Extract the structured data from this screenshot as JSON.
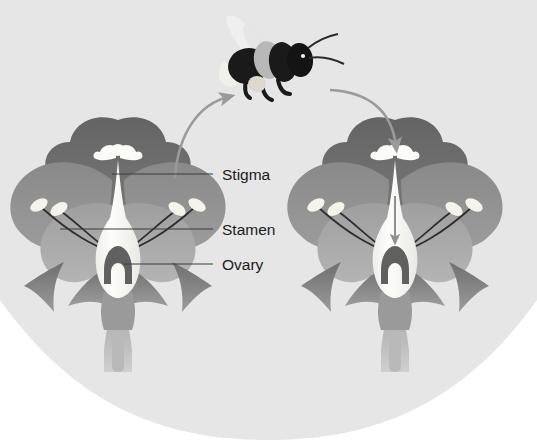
{
  "scene": {
    "title": "Flower pollination diagram",
    "background_color": "#ffffff",
    "backdrop_color": "#e6e6e6"
  },
  "labels": [
    {
      "id": "stigma",
      "text": "Stigma",
      "x": 222,
      "y": 180,
      "leader_from_x": 213,
      "leader_to_x": 112,
      "leader_y": 174
    },
    {
      "id": "stamen",
      "text": "Stamen",
      "x": 222,
      "y": 235,
      "leader_from_x": 213,
      "leader_to_x": 60,
      "leader_y": 229
    },
    {
      "id": "ovary",
      "text": "Ovary",
      "x": 222,
      "y": 270,
      "leader_from_x": 213,
      "leader_to_x": 124,
      "leader_y": 264
    }
  ],
  "flowers": [
    {
      "id": "left-flower",
      "name": "flower-left",
      "center_x": 118,
      "has_incoming_arrow": false,
      "has_internal_arrow": false,
      "anther_count": 4
    },
    {
      "id": "right-flower",
      "name": "flower-right",
      "center_x": 395,
      "has_incoming_arrow": true,
      "has_internal_arrow": true,
      "anther_count": 4
    }
  ],
  "pollinator": {
    "name": "bumblebee",
    "x": 268,
    "y": 62,
    "facing": "right",
    "body_color": "#1a1a1a",
    "band_color": "#b8b8b8",
    "pale_color": "#f2f0ea",
    "wing_color": "#efefef"
  },
  "arrows": [
    {
      "id": "arrow-flower-to-bee",
      "from": "left-flower-stigma",
      "to": "bee",
      "direction": "up-right",
      "color": "#9a9a9a"
    },
    {
      "id": "arrow-bee-to-flower",
      "from": "bee",
      "to": "right-flower-stigma",
      "direction": "down-right",
      "color": "#9a9a9a"
    },
    {
      "id": "arrow-pollen-descent",
      "from": "right-flower-stigma",
      "to": "right-flower-ovary",
      "direction": "down",
      "color": "#8f8f8f"
    }
  ],
  "palette": {
    "petal_back": "#6d6d6d",
    "petal_mid": "#8c8c8c",
    "petal_front": "#a5a5a5",
    "sepal": "#787878",
    "stem": "#b0b0b0",
    "pistil": "#fbfbf7",
    "ovary_cavity": "#606060",
    "filament": "#2e2e2e",
    "anther": "#f5f3ec",
    "leader_line": "#3a3a3a"
  }
}
